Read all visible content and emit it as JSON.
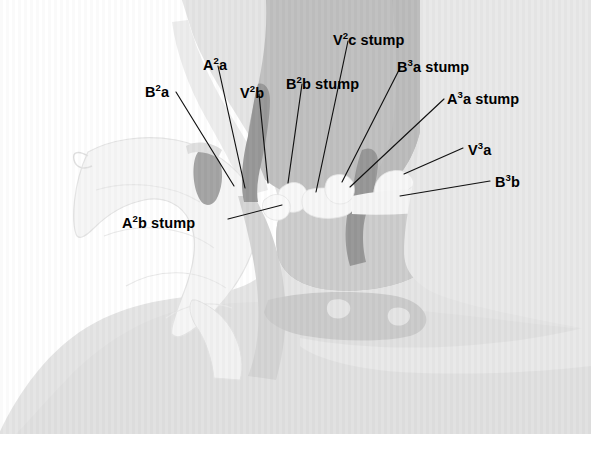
{
  "figure": {
    "domain": "anatomical-surgical-illustration",
    "width": 591,
    "height": 452,
    "background_color": "#ffffff"
  },
  "palette": {
    "page_background": "#ffffff",
    "chest_wall": "#c6c6c6",
    "chest_wall_shadow": "#b4b4b4",
    "dark_lobe": "#767676",
    "dark_lobe_shadow": "#6a6a6a",
    "mid_tissue": "#9a9a9a",
    "pale_lobe": "#dedede",
    "pale_lobe_edge": "#c0c0c0",
    "retracted_lobe": "#ebebeb",
    "vessel_dark": "#2b2b2b",
    "vessel_black": "#1a1a1a",
    "stump_white": "#f2f2f2",
    "leader_line": "#111111",
    "label_text": "#000000"
  },
  "labels": [
    {
      "id": "label-b2a",
      "name": "B2a",
      "text_main": "B",
      "text_sup": "2",
      "text_tail": "a",
      "x": 145,
      "y": 85,
      "anchor": "left"
    },
    {
      "id": "label-a2a",
      "name": "A2a",
      "text_main": "A",
      "text_sup": "2",
      "text_tail": "a",
      "x": 203,
      "y": 58,
      "anchor": "left"
    },
    {
      "id": "label-v2b",
      "name": "V2b",
      "text_main": "V",
      "text_sup": "2",
      "text_tail": "b",
      "x": 240,
      "y": 86,
      "anchor": "left"
    },
    {
      "id": "label-b2b-stump",
      "name": "B2b stump",
      "text_main": "B",
      "text_sup": "2",
      "text_tail": "b stump",
      "x": 286,
      "y": 77,
      "anchor": "left"
    },
    {
      "id": "label-v2c-stump",
      "name": "V2c stump",
      "text_main": "V",
      "text_sup": "2",
      "text_tail": "c stump",
      "x": 333,
      "y": 33,
      "anchor": "left"
    },
    {
      "id": "label-b3a-stump",
      "name": "B3a stump",
      "text_main": "B",
      "text_sup": "3",
      "text_tail": "a stump",
      "x": 397,
      "y": 60,
      "anchor": "left"
    },
    {
      "id": "label-a3a-stump",
      "name": "A3a stump",
      "text_main": "A",
      "text_sup": "3",
      "text_tail": "a stump",
      "x": 447,
      "y": 92,
      "anchor": "left"
    },
    {
      "id": "label-v3a",
      "name": "V3a",
      "text_main": "V",
      "text_sup": "3",
      "text_tail": "a",
      "x": 468,
      "y": 143,
      "anchor": "left"
    },
    {
      "id": "label-b3b",
      "name": "B3b",
      "text_main": "B",
      "text_sup": "3",
      "text_tail": "b",
      "x": 495,
      "y": 175,
      "anchor": "left"
    },
    {
      "id": "label-a2b-stump",
      "name": "A2b stump",
      "text_main": "A",
      "text_sup": "2",
      "text_tail": "b stump",
      "x": 122,
      "y": 216,
      "anchor": "left"
    }
  ],
  "leader_lines": [
    {
      "id": "leader-b2a",
      "from_label": "B2a",
      "points": "176,92 234,186"
    },
    {
      "id": "leader-a2a",
      "from_label": "A2a",
      "points": "218,66 245,188"
    },
    {
      "id": "leader-v2b",
      "from_label": "V2b",
      "points": "259,94 268,183"
    },
    {
      "id": "leader-b2b-stump",
      "from_label": "B2b stump",
      "points": "302,84 288,183"
    },
    {
      "id": "leader-v2c-stump",
      "from_label": "V2c stump",
      "points": "348,41 316,192"
    },
    {
      "id": "leader-b3a-stump",
      "from_label": "B3a stump",
      "points": "400,68 342,182"
    },
    {
      "id": "leader-a3a-stump",
      "from_label": "A3a stump",
      "points": "444,99 350,187"
    },
    {
      "id": "leader-v3a",
      "from_label": "V3a",
      "points": "463,148 404,174"
    },
    {
      "id": "leader-b3b",
      "from_label": "B3b",
      "points": "490,181 400,196"
    },
    {
      "id": "leader-a2b-stump",
      "from_label": "A2b stump",
      "points": "228,219 282,205"
    }
  ]
}
